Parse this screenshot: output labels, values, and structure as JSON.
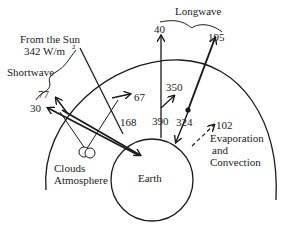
{
  "diagram": {
    "title_labels": {
      "sun": "From the Sun",
      "sun_flux": "342 W/m",
      "sun_flux_sup": "2",
      "shortwave": "Shortwave",
      "longwave": "Longwave",
      "clouds": "Clouds",
      "atmosphere": "Atmosphere",
      "earth": "Earth",
      "evap1": "Evaporation",
      "evap2": "and",
      "evap3": "Convection"
    },
    "values": {
      "reflected_total": "77",
      "reflected_surface": "30",
      "absorbed_atmos": "67",
      "absorbed_surface": "168",
      "lw_window": "40",
      "lw_surface": "390",
      "lw_atmos_up": "350",
      "lw_back": "324",
      "lw_out": "195",
      "evap": "102"
    },
    "colors": {
      "line": "#1a1a1a",
      "text": "#222222",
      "background": "#ffffff"
    }
  }
}
